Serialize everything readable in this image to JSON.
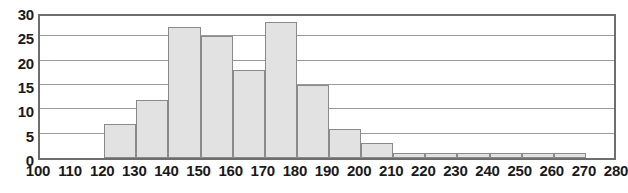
{
  "chart_data": {
    "type": "bar",
    "title": "",
    "subtitle": "",
    "xlabel": "",
    "ylabel": "",
    "grid": true,
    "legend": false,
    "bin_width": 10,
    "bin_edges": [
      100,
      110,
      120,
      130,
      140,
      150,
      160,
      170,
      180,
      190,
      200,
      210,
      220,
      230,
      240,
      250,
      260,
      270,
      280
    ],
    "categories": [
      "100-110",
      "110-120",
      "120-130",
      "130-140",
      "140-150",
      "150-160",
      "160-170",
      "170-180",
      "180-190",
      "190-200",
      "200-210",
      "210-220",
      "220-230",
      "230-240",
      "240-250",
      "250-260",
      "260-270",
      "270-280"
    ],
    "values": [
      0,
      0,
      7,
      12,
      27,
      25,
      18,
      28,
      15,
      6,
      3,
      1,
      1,
      1,
      1,
      1,
      1,
      0
    ],
    "xlim": [
      100,
      280
    ],
    "ylim": [
      0,
      30
    ],
    "x_ticks": [
      100,
      110,
      120,
      130,
      140,
      150,
      160,
      170,
      180,
      190,
      200,
      210,
      220,
      230,
      240,
      250,
      260,
      270,
      280
    ],
    "x_tick_labels": [
      "100",
      "110",
      "120",
      "130",
      "140",
      "150",
      "160",
      "170",
      "180",
      "190",
      "200",
      "210",
      "220",
      "230",
      "240",
      "250",
      "260",
      "270",
      "280"
    ],
    "y_ticks": [
      0,
      5,
      10,
      15,
      20,
      25,
      30
    ],
    "y_tick_labels": [
      "0",
      "5",
      "10",
      "15",
      "20",
      "25",
      "30"
    ],
    "colors": {
      "bar_fill": "#e2e2e2",
      "bar_edge": "#8a8a8a",
      "gridline": "#9a9a9a",
      "frame": "#6e6e6e",
      "text": "#1a1a1a",
      "background": "#ffffff"
    }
  }
}
